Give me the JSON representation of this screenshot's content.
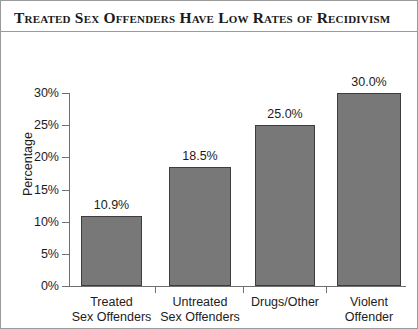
{
  "figure": {
    "title": "Treated Sex Offenders Have Low Rates of Recidivism",
    "frame_color": "#9a9a9a",
    "background": "#ffffff"
  },
  "chart_data": {
    "type": "bar",
    "title": "Treated Sex Offenders Have Low Rates of Recidivism",
    "xlabel": "",
    "ylabel": "Percentage",
    "ylim": [
      0,
      30
    ],
    "ytick_values": [
      0,
      5,
      10,
      15,
      20,
      25,
      30
    ],
    "ytick_labels": [
      "0%",
      "5%",
      "10%",
      "15%",
      "20%",
      "25%",
      "30%"
    ],
    "grid": false,
    "legend": false,
    "bar_color": "#787878",
    "bar_edge_color": "#3d3d3d",
    "categories": [
      "Treated\nSex Offenders",
      "Untreated\nSex Offenders",
      "Drugs/Other",
      "Violent\nOffender"
    ],
    "values": [
      10.9,
      18.5,
      25.0,
      30.0
    ],
    "value_labels": [
      "10.9%",
      "18.5%",
      "25.0%",
      "30.0%"
    ]
  }
}
